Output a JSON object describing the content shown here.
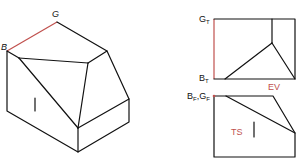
{
  "diagram": {
    "title": "",
    "pictorial": {
      "labels": {
        "g": "G",
        "b": "B",
        "face_mark": "|"
      },
      "edge_color": "#111111",
      "highlight_color": "#c0504d"
    },
    "top_view": {
      "labels": {
        "gt": "G",
        "gt_sub": "T",
        "bt": "B",
        "bt_sub": "T",
        "ev": "EV"
      }
    },
    "front_view": {
      "labels": {
        "bf": "B",
        "bf_sub": "F",
        "comma": ",",
        "gf": "G",
        "gf_sub": "F",
        "ts": "TS",
        "face_mark": "|"
      }
    }
  }
}
